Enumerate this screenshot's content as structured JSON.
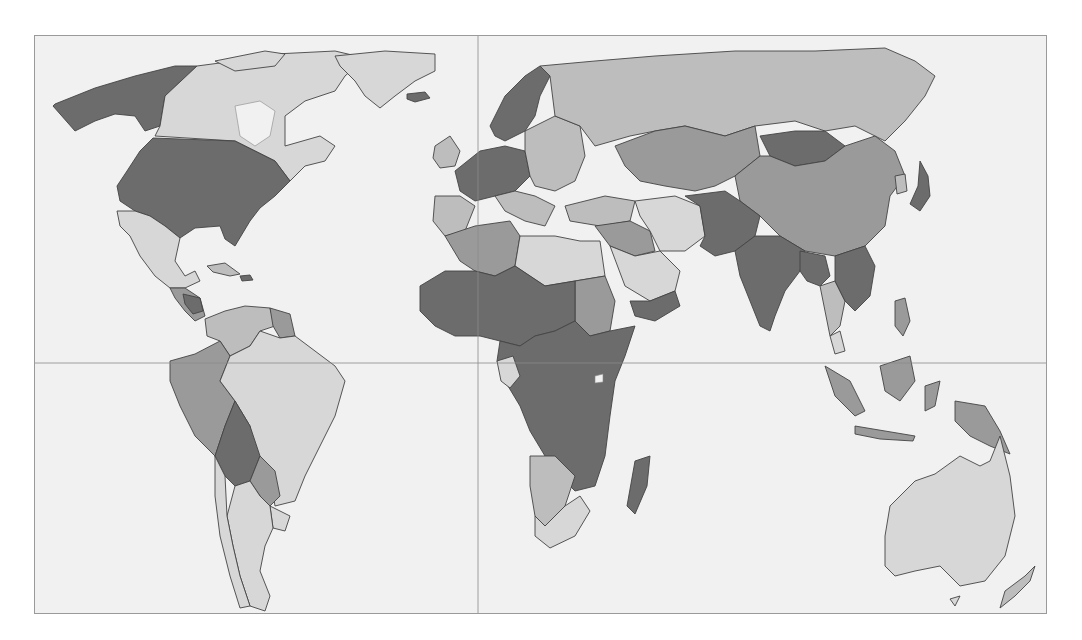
{
  "map": {
    "type": "world-choropleth",
    "projection": "equirectangular (Pacific split)",
    "legend_visible": false,
    "title_visible": false,
    "frame": {
      "x": 34,
      "y": 35,
      "width": 1013,
      "height": 579
    },
    "gridlines": {
      "equator_y": 362,
      "prime_meridian_x": 477
    },
    "palette": {
      "ocean": "#f1f1f1",
      "class_1_lightest": "#d7d7d7",
      "class_2_light": "#bdbdbd",
      "class_3_medium": "#9a9a9a",
      "class_4_dark": "#6c6c6c",
      "border": "#444444",
      "frame": "#9a9a9a"
    },
    "regions": [
      {
        "name": "Alaska (USA)",
        "class": 4
      },
      {
        "name": "Canada",
        "class": 1
      },
      {
        "name": "Greenland",
        "class": 1
      },
      {
        "name": "Iceland",
        "class": 4
      },
      {
        "name": "United States",
        "class": 4
      },
      {
        "name": "Mexico",
        "class": 1
      },
      {
        "name": "Central America",
        "class": 3
      },
      {
        "name": "Caribbean",
        "class": 2
      },
      {
        "name": "Colombia/Venezuela",
        "class": 2
      },
      {
        "name": "Guianas",
        "class": 3
      },
      {
        "name": "Ecuador/Peru",
        "class": 3
      },
      {
        "name": "Brazil",
        "class": 1
      },
      {
        "name": "Bolivia",
        "class": 4
      },
      {
        "name": "Paraguay",
        "class": 3
      },
      {
        "name": "Argentina/Chile",
        "class": 1
      },
      {
        "name": "Uruguay",
        "class": 1
      },
      {
        "name": "Scandinavia",
        "class": 4
      },
      {
        "name": "UK/Ireland",
        "class": 2
      },
      {
        "name": "Western Europe",
        "class": 4
      },
      {
        "name": "Iberia",
        "class": 2
      },
      {
        "name": "Eastern Europe",
        "class": 2
      },
      {
        "name": "Russia",
        "class": 2
      },
      {
        "name": "Turkey",
        "class": 2
      },
      {
        "name": "Kazakhstan/Central Asia",
        "class": 3
      },
      {
        "name": "Mongolia",
        "class": 4
      },
      {
        "name": "China",
        "class": 3
      },
      {
        "name": "Korea/Japan",
        "class": 4
      },
      {
        "name": "Middle East",
        "class": 3
      },
      {
        "name": "Saudi Arabia/Gulf",
        "class": 1
      },
      {
        "name": "Yemen",
        "class": 4
      },
      {
        "name": "Iran",
        "class": 1
      },
      {
        "name": "Afghanistan/Pakistan",
        "class": 4
      },
      {
        "name": "India",
        "class": 4
      },
      {
        "name": "Bangladesh/Myanmar",
        "class": 4
      },
      {
        "name": "Indochina",
        "class": 4
      },
      {
        "name": "Thailand",
        "class": 2
      },
      {
        "name": "Malaysia",
        "class": 1
      },
      {
        "name": "Indonesia",
        "class": 3
      },
      {
        "name": "Papua New Guinea",
        "class": 3
      },
      {
        "name": "Philippines",
        "class": 3
      },
      {
        "name": "Australia",
        "class": 1
      },
      {
        "name": "New Zealand",
        "class": 2
      },
      {
        "name": "North Africa (Maghreb)",
        "class": 3
      },
      {
        "name": "Libya/Egypt",
        "class": 1
      },
      {
        "name": "Sahel/West Africa",
        "class": 4
      },
      {
        "name": "Sudan",
        "class": 3
      },
      {
        "name": "Central/East Africa",
        "class": 4
      },
      {
        "name": "Namibia/Botswana",
        "class": 2
      },
      {
        "name": "South Africa",
        "class": 1
      },
      {
        "name": "Madagascar",
        "class": 4
      }
    ]
  }
}
